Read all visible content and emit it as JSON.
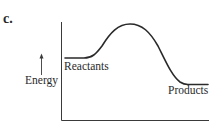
{
  "figure": {
    "part_label": "c.",
    "y_axis_label": "Energy",
    "labels": {
      "reactants": "Reactants",
      "products": "Products"
    }
  },
  "colors": {
    "line": "#2a2a2a",
    "background": "#ffffff"
  },
  "diagram": {
    "type": "energy-profile",
    "reactant_level": "high",
    "product_level": "low",
    "peak": "transition state between reactants and products"
  }
}
